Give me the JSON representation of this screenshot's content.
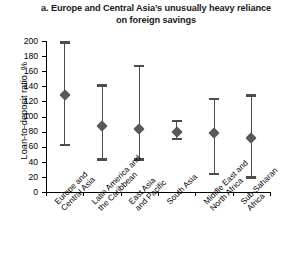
{
  "figure": {
    "panel_letter": "a.",
    "title": "a.  Europe and Central Asia’s unusually heavy reliance on foreign savings",
    "title_line1": "a.  Europe and Central Asia’s unusually heavy",
    "title_line2": "reliance on foreign savings",
    "background_color": "#ffffff",
    "marker_color": "#595959",
    "whisker_color": "#4d4d4d",
    "axis_color": "#000000"
  },
  "chart_data": {
    "type": "scatter",
    "title": "a.  Europe and Central Asia’s unusually heavy reliance on foreign savings",
    "xlabel": "",
    "ylabel": "Loan-to-deposit ratio, %",
    "ylim": [
      0,
      200
    ],
    "yticks": [
      0,
      20,
      40,
      60,
      80,
      100,
      120,
      140,
      160,
      180,
      200
    ],
    "ytick_labels": [
      "0",
      "20",
      "40",
      "60",
      "80",
      "100",
      "120",
      "140",
      "160",
      "180",
      "200"
    ],
    "grid": false,
    "legend": false,
    "error_bars": "min-max range",
    "categories": [
      "Europe and Central Asia",
      "Latin America and the Caribbean",
      "East Asia and Pacific",
      "South Asia",
      "Middle East and North Africa",
      "Sub-Saharan Africa"
    ],
    "category_lines": [
      [
        "Europe and",
        "Central Asia"
      ],
      [
        "Latin America and",
        "the Caribbean"
      ],
      [
        "East Asia",
        "and Pacific"
      ],
      [
        "South Asia"
      ],
      [
        "Middle East and",
        "North Africa"
      ],
      [
        "Sub-Saharan",
        "Africa"
      ]
    ],
    "values": [
      128,
      88,
      84,
      80,
      78,
      72
    ],
    "upper": [
      198,
      141,
      167,
      94,
      123,
      128
    ],
    "lower": [
      62,
      43,
      43,
      70,
      24,
      19
    ],
    "series": [
      {
        "name": "Loan-to-deposit ratio",
        "values": [
          128,
          88,
          84,
          80,
          78,
          72
        ],
        "upper": [
          198,
          141,
          167,
          94,
          123,
          128
        ],
        "lower": [
          62,
          43,
          43,
          70,
          24,
          19
        ]
      }
    ]
  }
}
